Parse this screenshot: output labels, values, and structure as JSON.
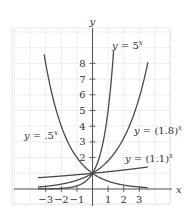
{
  "chart_data": {
    "type": "line",
    "title": "",
    "xlabel": "x",
    "ylabel": "y",
    "xlim": [
      -5,
      5
    ],
    "ylim": [
      -1,
      10
    ],
    "grid": true,
    "x_ticks": [
      -3,
      -2,
      -1,
      1,
      2,
      3
    ],
    "x_tick_labels": [
      "−3",
      "−2",
      "−1",
      "1",
      "2",
      "3"
    ],
    "y_ticks": [
      2,
      3,
      4,
      5,
      6,
      7,
      8
    ],
    "y_tick_labels": [
      "2",
      "3",
      "4",
      "5",
      "6",
      "7",
      "8"
    ],
    "series": [
      {
        "name": "y = 5^x",
        "label_base": "y = 5",
        "label_exp": "x",
        "base": 5,
        "domain": [
          -3.5,
          1.35
        ],
        "label_pos": [
          112,
          49
        ]
      },
      {
        "name": "y = (1.8)^x",
        "label_base": "y = (1.8)",
        "label_exp": "x",
        "base": 1.8,
        "domain": [
          -3.5,
          3.55
        ],
        "label_pos": [
          134,
          134
        ]
      },
      {
        "name": "y = (1.1)^x",
        "label_base": "y = (1.1)",
        "label_exp": "x",
        "base": 1.1,
        "domain": [
          -3.5,
          3.55
        ],
        "label_pos": [
          125,
          162
        ]
      },
      {
        "name": "y = .5^x",
        "label_base": "y = .5",
        "label_exp": "x",
        "base": 0.5,
        "domain": [
          -3.1,
          3.55
        ],
        "label_pos": [
          24,
          139
        ]
      }
    ],
    "annotations": [
      "All curves pass through (0, 1)"
    ]
  },
  "axis_labels": {
    "x": "x",
    "y": "y"
  }
}
